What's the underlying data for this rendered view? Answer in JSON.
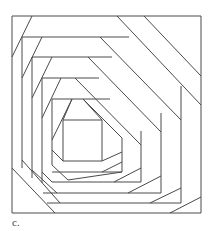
{
  "figure": {
    "caption": "c.",
    "stroke_color": "#4a4a4a",
    "background": "#ffffff",
    "frame": {
      "x1": 12,
      "y1": 16,
      "x2": 201,
      "y2": 213
    },
    "lines": [
      [
        12,
        16,
        201,
        16
      ],
      [
        201,
        16,
        201,
        213
      ],
      [
        201,
        213,
        12,
        213
      ],
      [
        12,
        213,
        12,
        16
      ],
      [
        32,
        16,
        12,
        57
      ],
      [
        117,
        16,
        201,
        105
      ],
      [
        144,
        16,
        201,
        76
      ],
      [
        12,
        168,
        55,
        213
      ],
      [
        170,
        213,
        201,
        197
      ],
      [
        22,
        37,
        129,
        37
      ],
      [
        22,
        37,
        22,
        168
      ],
      [
        42,
        37,
        22,
        78
      ],
      [
        100,
        37,
        181,
        120
      ],
      [
        181,
        86,
        181,
        203
      ],
      [
        22,
        160,
        60,
        203
      ],
      [
        47,
        203,
        181,
        203
      ],
      [
        150,
        203,
        181,
        188
      ],
      [
        32,
        57,
        112,
        57
      ],
      [
        32,
        57,
        32,
        178
      ],
      [
        52,
        57,
        32,
        98
      ],
      [
        88,
        57,
        161,
        132
      ],
      [
        161,
        113,
        161,
        193
      ],
      [
        32,
        170,
        57,
        193
      ],
      [
        43,
        193,
        161,
        193
      ],
      [
        128,
        193,
        161,
        176
      ],
      [
        42,
        78,
        99,
        78
      ],
      [
        42,
        78,
        42,
        183
      ],
      [
        61,
        78,
        42,
        118
      ],
      [
        75,
        78,
        141,
        145
      ],
      [
        141,
        131,
        141,
        182
      ],
      [
        42,
        172,
        52,
        182
      ],
      [
        52,
        182,
        141,
        182
      ],
      [
        114,
        182,
        141,
        168
      ],
      [
        52,
        99,
        110,
        99
      ],
      [
        52,
        99,
        52,
        165
      ],
      [
        72,
        99,
        52,
        140
      ],
      [
        83,
        99,
        122,
        138
      ],
      [
        122,
        138,
        122,
        172
      ],
      [
        52,
        165,
        68,
        180
      ],
      [
        68,
        180,
        122,
        172
      ],
      [
        52,
        172,
        122,
        172
      ],
      [
        102,
        172,
        122,
        162
      ],
      [
        63,
        120,
        102,
        120
      ],
      [
        102,
        120,
        102,
        161
      ],
      [
        102,
        161,
        63,
        161
      ],
      [
        63,
        161,
        63,
        120
      ],
      [
        63,
        120,
        72,
        99
      ],
      [
        102,
        120,
        83,
        99
      ],
      [
        102,
        161,
        122,
        152
      ],
      [
        63,
        161,
        52,
        150
      ]
    ]
  }
}
